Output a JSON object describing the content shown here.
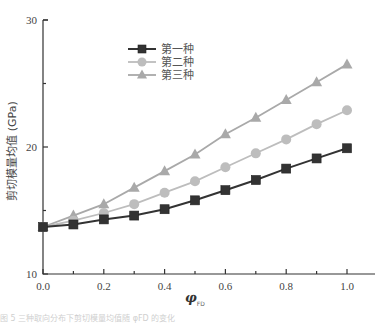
{
  "chart_data": {
    "type": "line",
    "title": "",
    "xlabel": "φ_FD",
    "xlabel_main": "φ",
    "xlabel_sub": "FD",
    "ylabel": "剪切模量均值 (GPa)",
    "xlim": [
      0.0,
      1.1
    ],
    "ylim": [
      10,
      30
    ],
    "grid": false,
    "legend_position": "upper-left-inside",
    "x": [
      0.0,
      0.1,
      0.2,
      0.3,
      0.4,
      0.5,
      0.6,
      0.7,
      0.8,
      0.9,
      1.0
    ],
    "x_ticks": [
      "0.0",
      "0.2",
      "0.4",
      "0.6",
      "0.8",
      "1.0"
    ],
    "y_ticks": [
      "10",
      "20",
      "30"
    ],
    "series": [
      {
        "name": "第一种",
        "marker": "square",
        "color": "#333333",
        "values": [
          13.7,
          13.9,
          14.3,
          14.6,
          15.1,
          15.8,
          16.6,
          17.4,
          18.3,
          19.1,
          19.9
        ]
      },
      {
        "name": "第二种",
        "marker": "circle",
        "color": "#bdbdbd",
        "values": [
          13.7,
          14.2,
          14.8,
          15.5,
          16.4,
          17.3,
          18.4,
          19.5,
          20.6,
          21.8,
          22.9
        ]
      },
      {
        "name": "第三种",
        "marker": "triangle",
        "color": "#a9a9a9",
        "values": [
          13.7,
          14.6,
          15.5,
          16.8,
          18.1,
          19.4,
          21.0,
          22.3,
          23.7,
          25.1,
          26.5
        ]
      }
    ]
  },
  "caption": "图 5 三种取向分布下剪切模量均值随 φFD 的变化"
}
